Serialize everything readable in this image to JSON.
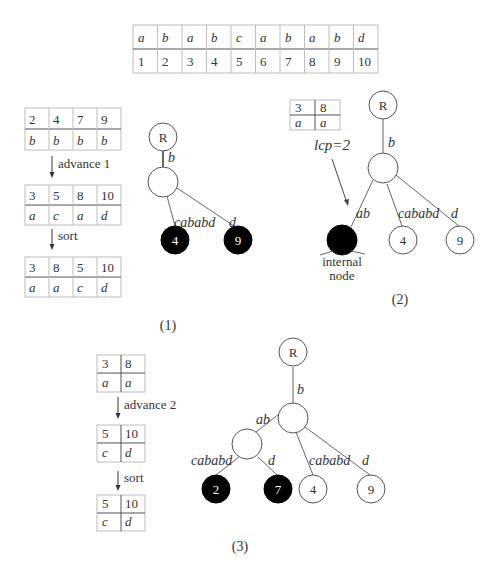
{
  "string_table": {
    "chars": [
      "a",
      "b",
      "a",
      "b",
      "c",
      "a",
      "b",
      "a",
      "b",
      "d"
    ],
    "positions": [
      "1",
      "2",
      "3",
      "4",
      "5",
      "6",
      "7",
      "8",
      "9",
      "10"
    ]
  },
  "panel1": {
    "caption": "(1)",
    "tables": [
      {
        "positions": [
          "2",
          "4",
          "7",
          "9"
        ],
        "chars": [
          "b",
          "b",
          "b",
          "b"
        ]
      },
      {
        "positions": [
          "3",
          "5",
          "8",
          "10"
        ],
        "chars": [
          "a",
          "c",
          "a",
          "d"
        ]
      },
      {
        "positions": [
          "3",
          "8",
          "5",
          "10"
        ],
        "chars": [
          "a",
          "a",
          "c",
          "d"
        ]
      }
    ],
    "steps": [
      "advance 1",
      "sort"
    ],
    "tree": {
      "root_label": "R",
      "edge_root": "b",
      "edges": [
        "cababd",
        "d"
      ],
      "leaves": [
        "4",
        "9"
      ]
    }
  },
  "panel2": {
    "caption": "(2)",
    "table": {
      "positions": [
        "3",
        "8"
      ],
      "chars": [
        "a",
        "a"
      ]
    },
    "annotation": "lcp=2",
    "internal_label_line1": "internal",
    "internal_label_line2": "node",
    "tree": {
      "root_label": "R",
      "edge_root": "b",
      "edges": [
        "ab",
        "cababd",
        "d"
      ],
      "leaves": [
        "4",
        "9"
      ]
    }
  },
  "panel3": {
    "caption": "(3)",
    "tables": [
      {
        "positions": [
          "3",
          "8"
        ],
        "chars": [
          "a",
          "a"
        ]
      },
      {
        "positions": [
          "5",
          "10"
        ],
        "chars": [
          "c",
          "d"
        ]
      },
      {
        "positions": [
          "5",
          "10"
        ],
        "chars": [
          "c",
          "d"
        ]
      }
    ],
    "steps": [
      "advance 2",
      "sort"
    ],
    "tree": {
      "root_label": "R",
      "edge_root": "b",
      "edges": [
        "ab",
        "cababd",
        "d",
        "cababd",
        "d"
      ],
      "leaves": [
        "2",
        "7",
        "4",
        "9"
      ]
    }
  },
  "colors": {
    "filled_node": "#000000",
    "open_node": "#ffffff",
    "line": "#666666",
    "cell_border": "#bdbdbd"
  }
}
